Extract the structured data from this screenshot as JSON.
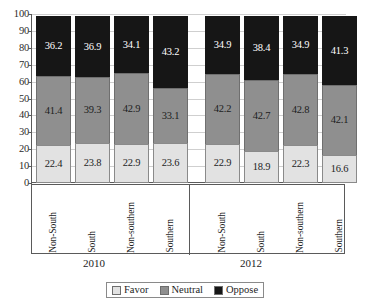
{
  "chart_data": {
    "type": "bar",
    "stacked": true,
    "title": "",
    "xlabel": "",
    "ylabel": "",
    "ylim": [
      0,
      100
    ],
    "ytick_step": 10,
    "yticks": [
      100,
      90,
      80,
      70,
      60,
      50,
      40,
      30,
      20,
      10,
      0
    ],
    "grid": true,
    "legend_position": "bottom-center",
    "categories": [
      "Non-South",
      "South",
      "Non-southern",
      "Southern",
      "Non-South",
      "South",
      "Non-southern",
      "Southern"
    ],
    "groups": [
      {
        "label": "2010",
        "categories": [
          "Non-South",
          "South",
          "Non-southern",
          "Southern"
        ]
      },
      {
        "label": "2012",
        "categories": [
          "Non-South",
          "South",
          "Non-southern",
          "Southern"
        ]
      }
    ],
    "series": [
      {
        "name": "Favor",
        "color": "#e2e2e2",
        "values": [
          22.4,
          23.8,
          22.9,
          23.6,
          22.9,
          18.9,
          22.3,
          16.6
        ]
      },
      {
        "name": "Neutral",
        "color": "#8f8f8f",
        "values": [
          41.4,
          39.3,
          42.9,
          33.1,
          42.2,
          42.7,
          42.8,
          42.1
        ]
      },
      {
        "name": "Oppose",
        "color": "#161616",
        "values": [
          36.2,
          36.9,
          34.1,
          43.2,
          34.9,
          38.4,
          34.9,
          41.3
        ]
      }
    ],
    "bars": [
      {
        "group": "2010",
        "category": "Non-South",
        "favor": 22.4,
        "neutral": 41.4,
        "oppose": 36.2
      },
      {
        "group": "2010",
        "category": "South",
        "favor": 23.8,
        "neutral": 39.3,
        "oppose": 36.9
      },
      {
        "group": "2010",
        "category": "Non-southern",
        "favor": 22.9,
        "neutral": 42.9,
        "oppose": 34.1
      },
      {
        "group": "2010",
        "category": "Southern",
        "favor": 23.6,
        "neutral": 33.1,
        "oppose": 43.2
      },
      {
        "group": "2012",
        "category": "Non-South",
        "favor": 22.9,
        "neutral": 42.2,
        "oppose": 34.9
      },
      {
        "group": "2012",
        "category": "South",
        "favor": 18.9,
        "neutral": 42.7,
        "oppose": 38.4
      },
      {
        "group": "2012",
        "category": "Non-southern",
        "favor": 22.3,
        "neutral": 42.8,
        "oppose": 34.9
      },
      {
        "group": "2012",
        "category": "Southern",
        "favor": 16.6,
        "neutral": 42.1,
        "oppose": 41.3
      }
    ],
    "legend": [
      {
        "label": "Favor",
        "color": "#e2e2e2"
      },
      {
        "label": "Neutral",
        "color": "#8f8f8f"
      },
      {
        "label": "Oppose",
        "color": "#161616"
      }
    ]
  }
}
